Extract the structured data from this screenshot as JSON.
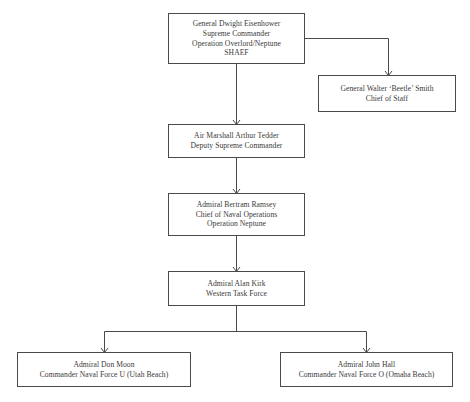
{
  "chart": {
    "title": "",
    "nodes": [
      {
        "id": "eisenhower",
        "lines": [
          "General Dwight Eisenhower",
          "Supreme Commander",
          "Operation Overlord/Neptune",
          "SHAEF"
        ]
      },
      {
        "id": "smith",
        "lines": [
          "General Walter ‘Beetle’ Smith",
          "Chief of Staff"
        ]
      },
      {
        "id": "tedder",
        "lines": [
          "Air Marshall Arthur Tedder",
          "Deputy Supreme Commander"
        ]
      },
      {
        "id": "ramsey",
        "lines": [
          "Admiral Bertram Ramsey",
          "Chief of Naval Operations",
          "Operation Neptune"
        ]
      },
      {
        "id": "kirk",
        "lines": [
          "Admiral Alan Kirk",
          "Western Task Force"
        ]
      },
      {
        "id": "moon",
        "lines": [
          "Admiral Don Moon",
          "Commander Naval Force U (Utah Beach)"
        ]
      },
      {
        "id": "hall",
        "lines": [
          "Admiral John Hall",
          "Commander Naval Force O (Omaha Beach)"
        ]
      }
    ],
    "edges": [
      {
        "from": "eisenhower",
        "to": "smith"
      },
      {
        "from": "eisenhower",
        "to": "tedder"
      },
      {
        "from": "tedder",
        "to": "ramsey"
      },
      {
        "from": "ramsey",
        "to": "kirk"
      },
      {
        "from": "kirk",
        "to": "moon"
      },
      {
        "from": "kirk",
        "to": "hall"
      }
    ],
    "colors": {
      "line": "#4a4a4a",
      "text": "#3a3a3a",
      "background": "#ffffff"
    }
  }
}
